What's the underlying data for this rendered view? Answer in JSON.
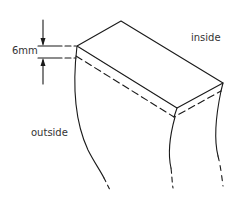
{
  "diagram": {
    "type": "technical-illustration",
    "labels": {
      "dimension": "6mm",
      "inside": "inside",
      "outside": "outside"
    },
    "colors": {
      "stroke": "#1a1a1a",
      "text": "#333333",
      "background": "#ffffff"
    }
  }
}
